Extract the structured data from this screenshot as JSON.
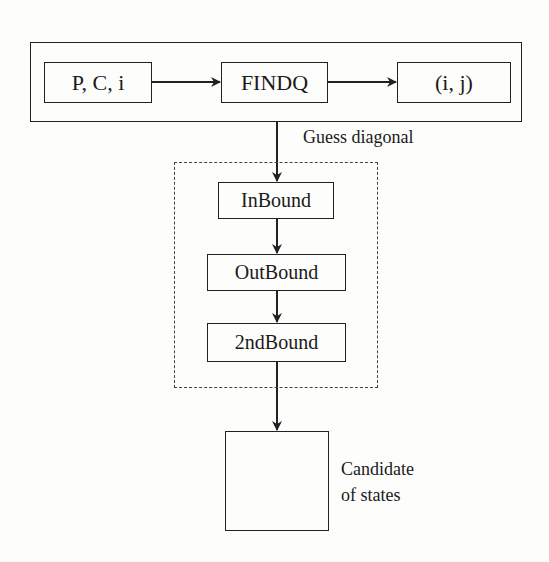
{
  "diagram": {
    "top_group": {
      "nodes": [
        {
          "id": "input",
          "label": "P, C, i"
        },
        {
          "id": "findq",
          "label": "FINDQ"
        },
        {
          "id": "output",
          "label": "(i, j)"
        }
      ]
    },
    "edge_label_guess": "Guess diagonal",
    "bound_group": {
      "nodes": [
        {
          "id": "inbound",
          "label": "InBound"
        },
        {
          "id": "outbound",
          "label": "OutBound"
        },
        {
          "id": "secondbound",
          "label": "2ndBound"
        }
      ]
    },
    "result_node": {
      "label_line1": "Candidate",
      "label_line2": "of states"
    },
    "edges": [
      {
        "from": "input",
        "to": "findq"
      },
      {
        "from": "findq",
        "to": "output"
      },
      {
        "from": "top_group",
        "to": "inbound",
        "label": "Guess diagonal"
      },
      {
        "from": "inbound",
        "to": "outbound"
      },
      {
        "from": "outbound",
        "to": "secondbound"
      },
      {
        "from": "secondbound",
        "to": "result_node"
      }
    ]
  }
}
